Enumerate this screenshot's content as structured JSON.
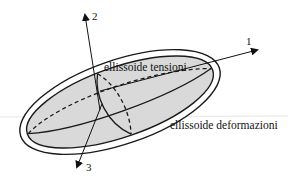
{
  "diagram": {
    "labels": {
      "stress_ellipsoid": "ellissoide tensioni",
      "strain_ellipsoid": "ellissoide deformazioni"
    },
    "axes": [
      {
        "id": "1",
        "label": "1"
      },
      {
        "id": "2",
        "label": "2"
      },
      {
        "id": "3",
        "label": "3"
      }
    ],
    "colors": {
      "fill_inner": "#d9d9d9",
      "stroke": "#1a1a1a",
      "background": "#ffffff"
    }
  }
}
